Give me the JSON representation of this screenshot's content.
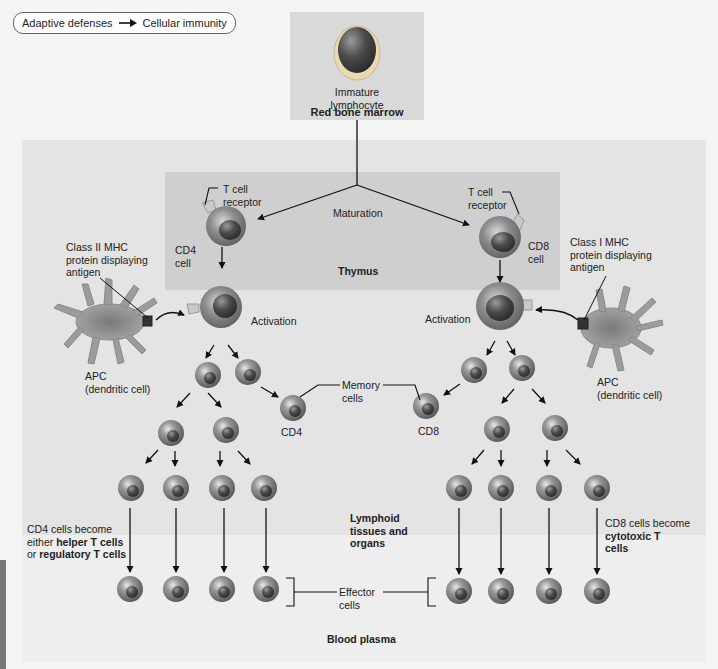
{
  "breadcrumb": {
    "from": "Adaptive defenses",
    "to": "Cellular immunity",
    "separator_icon": "right-arrow-icon"
  },
  "regions": {
    "red_bone_marrow": "Red bone marrow",
    "thymus": "Thymus",
    "lymphoid": [
      "Lymphoid",
      "tissues and",
      "organs"
    ],
    "blood_plasma": "Blood plasma"
  },
  "labels": {
    "immature_lymphocyte": [
      "Immature",
      "lymphocyte"
    ],
    "maturation": "Maturation",
    "t_cell_receptor_left": [
      "T cell",
      "receptor"
    ],
    "t_cell_receptor_right": [
      "T cell",
      "receptor"
    ],
    "cd4_cell": [
      "CD4",
      "cell"
    ],
    "cd8_cell": [
      "CD8",
      "cell"
    ],
    "class_ii_mhc": [
      "Class II MHC",
      "protein displaying",
      "antigen"
    ],
    "class_i_mhc": [
      "Class I MHC",
      "protein displaying",
      "antigen"
    ],
    "activation_left": "Activation",
    "activation_right": "Activation",
    "apc_left": [
      "APC",
      "(dendritic cell)"
    ],
    "apc_right": [
      "APC",
      "(dendritic cell)"
    ],
    "memory_cells": [
      "Memory",
      "cells"
    ],
    "memory_cd4": "CD4",
    "memory_cd8": "CD8",
    "effector_cells": [
      "Effector",
      "cells"
    ],
    "cd4_fate": {
      "line1": "CD4 cells become",
      "line2_prefix": "either ",
      "line2_bold": "helper T cells",
      "line3_prefix": "or ",
      "line3_bold": "regulatory T cells"
    },
    "cd8_fate": {
      "line1": "CD8 cells become",
      "line2_bold": "cytotoxic T",
      "line3_bold": "cells"
    }
  },
  "colors": {
    "marrow_panel": "#d9d9d9",
    "lymphoid_panel": "#e4e4e4",
    "thymus_panel": "#cfcfcf",
    "blood_panel": "#eeeeee",
    "cell_gray": "#8a8a8a",
    "apc_gray": "#9a9a9a",
    "line": "#111111"
  }
}
